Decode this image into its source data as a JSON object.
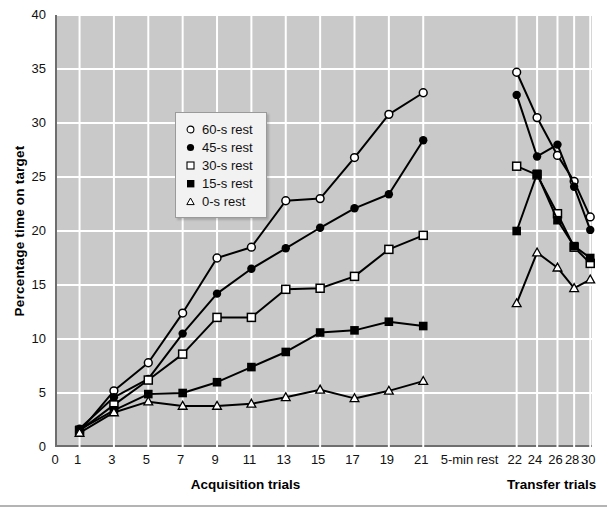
{
  "chart_data": {
    "type": "line",
    "title": "",
    "xlabel": "",
    "ylabel": "Percentage time on target",
    "ylim": [
      0,
      40
    ],
    "yticks": [
      0,
      5,
      10,
      15,
      20,
      25,
      30,
      35,
      40
    ],
    "grid": true,
    "legend_position": "upper-left-inside",
    "phases": [
      {
        "name": "Acquisition trials",
        "trials": [
          1,
          3,
          5,
          7,
          9,
          11,
          13,
          15,
          17,
          19,
          21
        ]
      },
      {
        "name": "Transfer trials",
        "trials": [
          22,
          24,
          26,
          28,
          30
        ]
      }
    ],
    "xticks": [
      "0",
      "1",
      "3",
      "5",
      "7",
      "9",
      "11",
      "13",
      "15",
      "17",
      "19",
      "21",
      "5-min rest",
      "22",
      "24",
      "26",
      "28",
      "30"
    ],
    "break_label": "5-min rest",
    "series": [
      {
        "name": "60-s rest",
        "marker": "open-circle",
        "acquisition": [
          1.4,
          5.2,
          7.8,
          12.4,
          17.5,
          18.5,
          22.8,
          23.0,
          26.8,
          30.8,
          32.8
        ],
        "transfer": [
          34.7,
          30.5,
          27.0,
          24.6,
          21.3
        ]
      },
      {
        "name": "45-s rest",
        "marker": "filled-circle",
        "acquisition": [
          1.7,
          4.6,
          6.3,
          10.5,
          14.2,
          16.5,
          18.4,
          20.3,
          22.1,
          23.4,
          28.4
        ],
        "transfer": [
          32.6,
          26.9,
          28.0,
          24.1,
          20.1
        ]
      },
      {
        "name": "30-s rest",
        "marker": "open-square",
        "acquisition": [
          1.5,
          3.9,
          6.2,
          8.6,
          12.0,
          12.0,
          14.6,
          14.7,
          15.8,
          18.3,
          19.6
        ],
        "transfer": [
          26.0,
          25.2,
          21.6,
          18.5,
          17.0
        ]
      },
      {
        "name": "15-s rest",
        "marker": "filled-square",
        "acquisition": [
          1.6,
          3.4,
          4.9,
          5.0,
          6.0,
          7.4,
          8.8,
          10.6,
          10.8,
          11.6,
          11.2
        ],
        "transfer": [
          20.0,
          25.3,
          21.0,
          18.6,
          17.5
        ]
      },
      {
        "name": "0-s rest",
        "marker": "open-triangle",
        "acquisition": [
          1.3,
          3.2,
          4.2,
          3.8,
          3.8,
          4.0,
          4.6,
          5.3,
          4.5,
          5.2,
          6.1
        ],
        "transfer": [
          13.3,
          18.0,
          16.6,
          14.7,
          15.5
        ]
      }
    ]
  },
  "colors": {
    "plot_background": "#c9c9c9",
    "gridlines": "#ffffff",
    "axis": "#6e6e6e",
    "series_line": "#000000",
    "legend_background": "#f2f2f2"
  }
}
